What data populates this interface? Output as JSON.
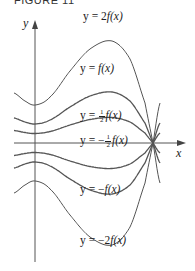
{
  "figure": {
    "title": "FIGURE 11",
    "x_axis_label": "x",
    "y_axis_label": "y",
    "curves": [
      {
        "name": "2f",
        "label_prefix": "y = 2",
        "label_func": "f(x)",
        "factor": 2,
        "label_x": 83,
        "label_y": 20
      },
      {
        "name": "f",
        "label_prefix": "y = ",
        "label_func": "f(x)",
        "factor": 1,
        "label_x": 80,
        "label_y": 72
      },
      {
        "name": "half-f",
        "label_prefix": "y = ",
        "label_frac": "1/2",
        "label_func": "f(x)",
        "factor": 0.5,
        "label_x": 80,
        "label_y": 119
      },
      {
        "name": "neg-half-f",
        "label_prefix": "y = −",
        "label_frac": "1/2",
        "label_func": "f(x)",
        "factor": -0.5,
        "label_x": 80,
        "label_y": 144
      },
      {
        "name": "neg-f",
        "label_prefix": "y = −",
        "label_func": "f(x)",
        "factor": -1,
        "label_x": 80,
        "label_y": 193
      },
      {
        "name": "neg-2f",
        "label_prefix": "y = −2",
        "label_func": "f(x)",
        "factor": -2,
        "label_x": 80,
        "label_y": 244
      }
    ],
    "colors": {
      "axis": "#555555",
      "curve": "#555555",
      "text": "#222222"
    }
  }
}
